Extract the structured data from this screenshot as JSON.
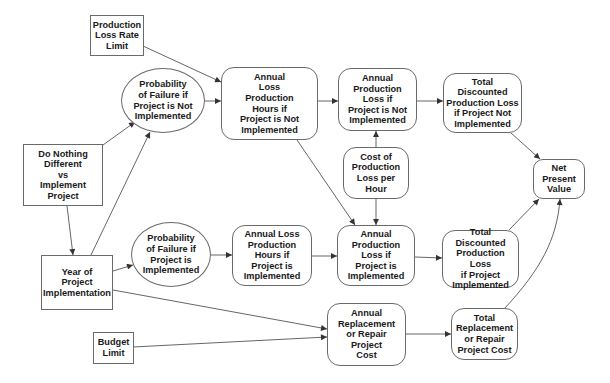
{
  "diagram": {
    "type": "influence-diagram",
    "colors": {
      "line": "#555555",
      "border": "#6a6a6a",
      "text": "#1a1a1a",
      "background": "#ffffff"
    },
    "nodes": {
      "production_loss_rate_limit": {
        "label": "Production\nLoss Rate\nLimit",
        "shape": "rectangle"
      },
      "prob_failure_not_impl": {
        "label": "Probability\nof Failure if\nProject is Not\nImplemented",
        "shape": "ellipse"
      },
      "annual_loss_hours_not_impl": {
        "label": "Annual\nLoss\nProduction\nHours if\nProject is Not\nImplemented",
        "shape": "rounded-rectangle"
      },
      "annual_prod_loss_not_impl": {
        "label": "Annual\nProduction\nLoss if\nProject is Not\nImplemented",
        "shape": "rounded-rectangle"
      },
      "total_disc_loss_not_impl": {
        "label": "Total Discounted\nProduction Loss\nif Project Not\nImplemented",
        "shape": "rounded-rectangle"
      },
      "do_nothing_vs_implement": {
        "label": "Do Nothing\nDifferent\nvs\nImplement\nProject",
        "shape": "rectangle"
      },
      "cost_per_hour": {
        "label": "Cost of\nProduction\nLoss per\nHour",
        "shape": "rounded-rectangle"
      },
      "net_present_value": {
        "label": "Net\nPresent\nValue",
        "shape": "rounded-rectangle"
      },
      "prob_failure_impl": {
        "label": "Probability\nof Failure if\nProject is\nImplemented",
        "shape": "ellipse"
      },
      "annual_loss_hours_impl": {
        "label": "Annual Loss\nProduction\nHours if\nProject is\nImplemented",
        "shape": "rounded-rectangle"
      },
      "annual_prod_loss_impl": {
        "label": "Annual\nProduction\nLoss if\nProject is\nImplemented",
        "shape": "rounded-rectangle"
      },
      "total_disc_loss_impl": {
        "label": "Total Discounted\nProduction Loss\nif Project\nImplemented",
        "shape": "rounded-rectangle"
      },
      "year_of_implementation": {
        "label": "Year of\nProject\nImplementation",
        "shape": "rectangle"
      },
      "budget_limit": {
        "label": "Budget\nLimit",
        "shape": "rectangle"
      },
      "annual_replacement_cost": {
        "label": "Annual\nReplacement\nor Repair\nProject\nCost",
        "shape": "rounded-rectangle"
      },
      "total_replacement_cost": {
        "label": "Total\nReplacement\nor Repair\nProject Cost",
        "shape": "rounded-rectangle"
      }
    },
    "edges": [
      {
        "from": "production_loss_rate_limit",
        "to": "annual_loss_hours_not_impl"
      },
      {
        "from": "prob_failure_not_impl",
        "to": "annual_loss_hours_not_impl"
      },
      {
        "from": "annual_loss_hours_not_impl",
        "to": "annual_prod_loss_not_impl"
      },
      {
        "from": "annual_loss_hours_not_impl",
        "to": "annual_prod_loss_impl"
      },
      {
        "from": "annual_prod_loss_not_impl",
        "to": "total_disc_loss_not_impl"
      },
      {
        "from": "total_disc_loss_not_impl",
        "to": "net_present_value"
      },
      {
        "from": "do_nothing_vs_implement",
        "to": "prob_failure_not_impl"
      },
      {
        "from": "do_nothing_vs_implement",
        "to": "year_of_implementation"
      },
      {
        "from": "year_of_implementation",
        "to": "prob_failure_not_impl"
      },
      {
        "from": "year_of_implementation",
        "to": "prob_failure_impl"
      },
      {
        "from": "year_of_implementation",
        "to": "annual_replacement_cost"
      },
      {
        "from": "cost_per_hour",
        "to": "annual_prod_loss_not_impl"
      },
      {
        "from": "cost_per_hour",
        "to": "annual_prod_loss_impl"
      },
      {
        "from": "prob_failure_impl",
        "to": "annual_loss_hours_impl"
      },
      {
        "from": "annual_loss_hours_impl",
        "to": "annual_prod_loss_impl"
      },
      {
        "from": "annual_prod_loss_impl",
        "to": "total_disc_loss_impl"
      },
      {
        "from": "total_disc_loss_impl",
        "to": "net_present_value"
      },
      {
        "from": "budget_limit",
        "to": "annual_replacement_cost"
      },
      {
        "from": "annual_replacement_cost",
        "to": "total_replacement_cost"
      },
      {
        "from": "total_replacement_cost",
        "to": "net_present_value"
      }
    ]
  }
}
